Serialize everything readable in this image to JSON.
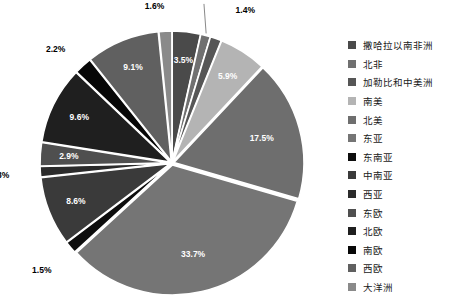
{
  "chart_data": {
    "type": "pie",
    "title": "",
    "subtitle": "",
    "xlabel": "",
    "ylabel": "",
    "grid": false,
    "legend_position": "right",
    "start_angle_deg": -90,
    "direction": "clockwise",
    "center": {
      "x": 172,
      "y": 163
    },
    "radius": 130,
    "categories": [
      "撒哈拉以南非洲",
      "北非",
      "加勒比和中美洲",
      "南美",
      "北美",
      "东亚",
      "东南亚",
      "中南亚",
      "西亚",
      "东欧",
      "北欧",
      "南欧",
      "西欧",
      "大洋洲"
    ],
    "values": [
      3.5,
      1.2,
      1.4,
      5.9,
      17.5,
      33.7,
      1.5,
      8.6,
      1.3,
      2.9,
      9.6,
      2.2,
      9.1,
      1.6
    ],
    "value_labels": [
      "3.5%",
      "1.2%",
      "1.4%",
      "5.9%",
      "17.5%",
      "33.7%",
      "1.5%",
      "8.6%",
      "1.3%",
      "2.9%",
      "9.6%",
      "2.2%",
      "9.1%",
      "1.6%"
    ],
    "colors": [
      "#4a4a4a",
      "#707070",
      "#565656",
      "#b4b4b4",
      "#6e6e6e",
      "#757575",
      "#0d0d0d",
      "#3a3a3a",
      "#2b2b2b",
      "#4f4f4f",
      "#1f1f1f",
      "#070707",
      "#606060",
      "#8a8a8a"
    ],
    "label_inside": [
      true,
      false,
      false,
      true,
      true,
      true,
      false,
      true,
      false,
      true,
      true,
      false,
      true,
      false
    ],
    "slice_border_color": "#ffffff",
    "background_color": "#ffffff"
  },
  "legend": {
    "items": [
      {
        "label": "撒哈拉以南非洲",
        "color": "#4a4a4a"
      },
      {
        "label": "北非",
        "color": "#707070"
      },
      {
        "label": "加勒比和中美洲",
        "color": "#565656"
      },
      {
        "label": "南美",
        "color": "#b4b4b4"
      },
      {
        "label": "北美",
        "color": "#6e6e6e"
      },
      {
        "label": "东亚",
        "color": "#757575"
      },
      {
        "label": "东南亚",
        "color": "#0d0d0d"
      },
      {
        "label": "中南亚",
        "color": "#3a3a3a"
      },
      {
        "label": "西亚",
        "color": "#2b2b2b"
      },
      {
        "label": "东欧",
        "color": "#4f4f4f"
      },
      {
        "label": "北欧",
        "color": "#1f1f1f"
      },
      {
        "label": "南欧",
        "color": "#070707"
      },
      {
        "label": "西欧",
        "color": "#606060"
      },
      {
        "label": "大洋洲",
        "color": "#8a8a8a"
      }
    ]
  }
}
